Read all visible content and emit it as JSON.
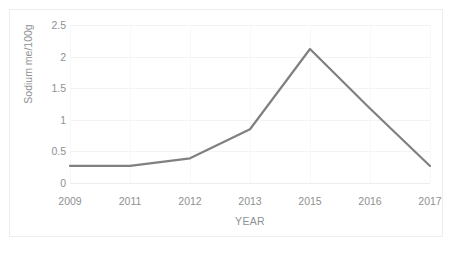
{
  "chart_data": {
    "type": "line",
    "title": "",
    "xlabel": "YEAR",
    "ylabel": "Sodium me/100g",
    "categories": [
      "2009",
      "2011",
      "2012",
      "2013",
      "2015",
      "2016",
      "2017"
    ],
    "values": [
      0.27,
      0.27,
      0.39,
      0.85,
      2.12,
      1.18,
      0.27
    ],
    "series": [
      {
        "name": "Sodium",
        "values": [
          0.27,
          0.27,
          0.39,
          0.85,
          2.12,
          1.18,
          0.27
        ]
      }
    ],
    "ylim": [
      0,
      2.5
    ],
    "yticks": [
      "0",
      "0.5",
      "1",
      "1.5",
      "2",
      "2.5"
    ],
    "ytick_values": [
      0,
      0.5,
      1,
      1.5,
      2,
      2.5
    ],
    "grid": true,
    "legend": "none",
    "line_color": "#7f8181",
    "gridline_color": "#f2f3f3",
    "axis_text_color": "#8e9192",
    "plot_background": "#ffffff",
    "border_color": "#eceded"
  }
}
